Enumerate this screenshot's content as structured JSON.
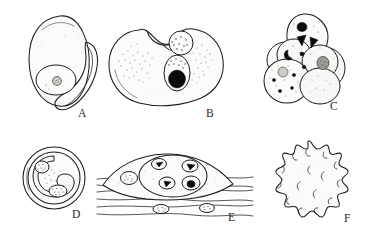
{
  "figure": {
    "style": "pen-and-ink stipple line drawing",
    "background_color": "#ffffff",
    "ink_color": "#1d1d1d",
    "panel_count": 6,
    "panels": [
      {
        "label": "A",
        "name": "panel-a",
        "description": "Ovoid cell with large round nucleus containing a central karyosome, and a crescent sickle-shaped body along the right side",
        "label_x": 78,
        "label_y": 114
      },
      {
        "label": "B",
        "name": "panel-b",
        "description": "Large bean-shaped cell with notched upper margin, one stippled round nucleus and one oval vacuole enclosing a solid black mass; cytoplasm finely stippled",
        "label_x": 206,
        "label_y": 111
      },
      {
        "label": "C",
        "name": "panel-c",
        "description": "Cluster of six overlapping rounded cells; uppermost cell bears three solid black inclusions, lower cells lightly stippled",
        "label_x": 330,
        "label_y": 108
      },
      {
        "label": "D",
        "name": "panel-d",
        "description": "Round double-walled cyst enclosing a C-shaped inner body with two stippled nuclei",
        "label_x": 72,
        "label_y": 218
      },
      {
        "label": "E",
        "name": "panel-e",
        "description": "Lens-shaped cyst lying within striated muscle tissue; contains several stippled nuclei, with two elongated muscle nuclei below",
        "label_x": 230,
        "label_y": 218
      },
      {
        "label": "F",
        "name": "panel-f",
        "description": "Spiky star-shaped cell with about fifteen rounded blunt projections, each with a small internal hook mark",
        "label_x": 345,
        "label_y": 213
      }
    ]
  }
}
